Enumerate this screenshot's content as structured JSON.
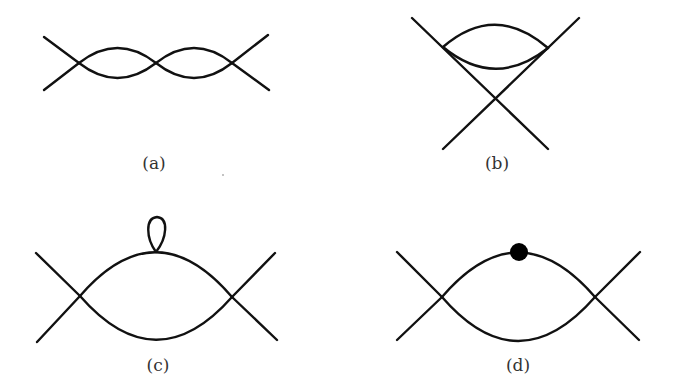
{
  "figure": {
    "panels": [
      {
        "id": "a",
        "label": "(a)",
        "description": "Two-loop chain of bubbles with external legs at both ends"
      },
      {
        "id": "b",
        "label": "(b)",
        "description": "Bubble attached above a crossing of two external lines"
      },
      {
        "id": "c",
        "label": "(c)",
        "description": "One-loop bubble with a tadpole loop on the upper propagator"
      },
      {
        "id": "d",
        "label": "(d)",
        "description": "One-loop bubble with a filled dot insertion on the upper propagator"
      }
    ],
    "colors": {
      "line": "#111111",
      "label": "#333333",
      "background": "#ffffff",
      "dot": "#000000"
    }
  }
}
